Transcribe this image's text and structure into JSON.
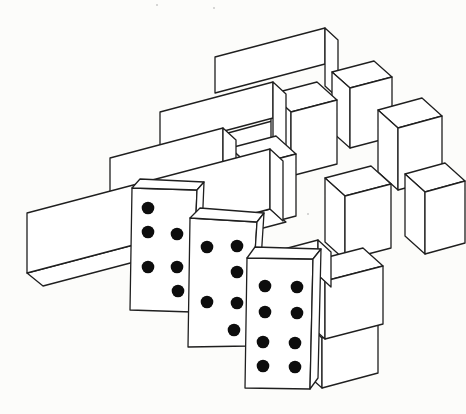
{
  "meta": {
    "paper_color": "#fcfcfa",
    "ink_color": "#1f1f1f",
    "fill_color": "#ffffff",
    "pip_color": "#0d0d0d",
    "line_width": 1.3,
    "canvas": {
      "width": 466,
      "height": 414
    }
  },
  "drawing": {
    "slope": 0.265,
    "pieces": [
      {
        "kind": "beam",
        "name": "beam-top",
        "x": 215,
        "y": 57,
        "len": 110,
        "h": 36,
        "cap": [
          13,
          12
        ],
        "cap_extra": 22
      },
      {
        "kind": "block",
        "name": "block-upper-right",
        "x": 350,
        "y": 88,
        "w": 42,
        "h": 60,
        "depth": [
          18,
          16
        ]
      },
      {
        "kind": "beam",
        "name": "beam-row3-rear",
        "x": 228,
        "y": 133,
        "len": 70,
        "h": 34,
        "cap": [
          13,
          12
        ],
        "cap_extra": 0
      },
      {
        "kind": "block",
        "name": "block-row2-left",
        "x": 291,
        "y": 112,
        "w": 46,
        "h": 64,
        "depth": [
          20,
          18
        ]
      },
      {
        "kind": "beam",
        "name": "beam-row2",
        "x": 160,
        "y": 112,
        "len": 113,
        "h": 36,
        "cap": [
          13,
          12
        ],
        "cap_extra": 20
      },
      {
        "kind": "block",
        "name": "block-row2-right",
        "x": 398,
        "y": 128,
        "w": 44,
        "h": 62,
        "depth": [
          20,
          18
        ]
      },
      {
        "kind": "block",
        "name": "block-row3-left",
        "x": 250,
        "y": 166,
        "w": 46,
        "h": 62,
        "depth": [
          20,
          18
        ]
      },
      {
        "kind": "beam",
        "name": "beam-row3",
        "x": 110,
        "y": 158,
        "len": 113,
        "h": 35,
        "cap": [
          13,
          12
        ],
        "cap_extra": 20
      },
      {
        "kind": "block",
        "name": "block-row3-mid",
        "x": 345,
        "y": 196,
        "w": 46,
        "h": 64,
        "depth": [
          20,
          18
        ]
      },
      {
        "kind": "block",
        "name": "block-row3-right",
        "x": 425,
        "y": 192,
        "w": 40,
        "h": 62,
        "depth": [
          20,
          18
        ]
      },
      {
        "kind": "beam",
        "name": "beam-bottom-long",
        "x": 27,
        "y": 213,
        "len": 243,
        "h": 60,
        "cap": [
          13,
          12
        ],
        "cap_extra": 0,
        "bottom": [
          16,
          13
        ]
      },
      {
        "kind": "block",
        "name": "block-bottom-lower",
        "x": 322,
        "y": 338,
        "w": 56,
        "h": 50,
        "depth": [
          18,
          16
        ]
      },
      {
        "kind": "block",
        "name": "block-bottom-upper",
        "x": 325,
        "y": 281,
        "w": 58,
        "h": 58,
        "depth": [
          20,
          18
        ]
      },
      {
        "kind": "beam",
        "name": "beam-bottom-rear",
        "x": 235,
        "y": 262,
        "len": 83,
        "h": 35,
        "cap": [
          13,
          12
        ],
        "cap_extra": 0
      }
    ],
    "dominoes": [
      {
        "name": "domino-left",
        "pip_count": 6,
        "pip_rows": [
          [
            "L"
          ],
          [
            "L",
            "R"
          ],
          [
            "L",
            "R"
          ],
          [
            "R"
          ]
        ],
        "front": [
          [
            132,
            188
          ],
          [
            197,
            190
          ],
          [
            192,
            312
          ],
          [
            130,
            310
          ]
        ],
        "top": [
          [
            132,
            188
          ],
          [
            140,
            179
          ],
          [
            204,
            182
          ],
          [
            197,
            190
          ]
        ],
        "side": [
          [
            197,
            190
          ],
          [
            204,
            182
          ],
          [
            199,
            304
          ],
          [
            192,
            312
          ]
        ],
        "pips": [
          [
            148,
            208
          ],
          [
            148,
            232
          ],
          [
            177,
            234
          ],
          [
            148,
            267
          ],
          [
            177,
            267
          ],
          [
            178,
            291
          ]
        ]
      },
      {
        "name": "domino-middle",
        "pip_count": 6,
        "pip_rows": [
          [
            "L",
            "R"
          ],
          [
            "R"
          ],
          [
            "L",
            "R"
          ],
          [
            "R"
          ]
        ],
        "front": [
          [
            190,
            218
          ],
          [
            257,
            222
          ],
          [
            249,
            346
          ],
          [
            188,
            347
          ]
        ],
        "top": [
          [
            190,
            218
          ],
          [
            200,
            208
          ],
          [
            264,
            213
          ],
          [
            257,
            222
          ]
        ],
        "side": [
          [
            257,
            222
          ],
          [
            264,
            213
          ],
          [
            256,
            338
          ],
          [
            249,
            346
          ]
        ],
        "pips": [
          [
            207,
            247
          ],
          [
            237,
            246
          ],
          [
            237,
            272
          ],
          [
            207,
            302
          ],
          [
            237,
            303
          ],
          [
            234,
            330
          ]
        ]
      },
      {
        "name": "domino-right",
        "pip_count": 8,
        "pip_rows": [
          [
            "L",
            "R"
          ],
          [
            "L",
            "R"
          ],
          [
            "L",
            "R"
          ],
          [
            "L",
            "R"
          ]
        ],
        "front": [
          [
            247,
            258
          ],
          [
            313,
            259
          ],
          [
            310,
            389
          ],
          [
            245,
            388
          ]
        ],
        "top": [
          [
            247,
            258
          ],
          [
            255,
            247
          ],
          [
            321,
            249
          ],
          [
            313,
            259
          ]
        ],
        "side": [
          [
            313,
            259
          ],
          [
            321,
            249
          ],
          [
            318,
            378
          ],
          [
            310,
            389
          ]
        ],
        "pips": [
          [
            265,
            286
          ],
          [
            297,
            287
          ],
          [
            265,
            312
          ],
          [
            297,
            313
          ],
          [
            263,
            342
          ],
          [
            295,
            343
          ],
          [
            263,
            366
          ],
          [
            295,
            367
          ]
        ]
      }
    ],
    "pip_radius": 6.3,
    "specks": [
      [
        157,
        5
      ],
      [
        214,
        8
      ],
      [
        308,
        214
      ]
    ]
  }
}
